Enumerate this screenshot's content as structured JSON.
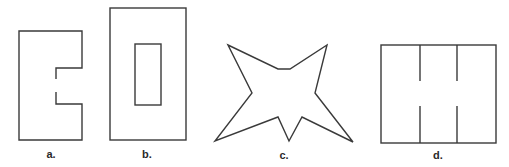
{
  "figures": [
    {
      "id": "a",
      "label": "a.",
      "description": "rectangle with notch cut into right side, open gap in notch"
    },
    {
      "id": "b",
      "label": "b.",
      "description": "rectangle containing inner rectangle"
    },
    {
      "id": "c",
      "label": "c.",
      "description": "irregular star-shaped polygon"
    },
    {
      "id": "d",
      "label": "d.",
      "description": "rectangle with two partial vertical dividers"
    }
  ],
  "colors": {
    "stroke": "#3a3a3a",
    "background": "#ffffff"
  }
}
